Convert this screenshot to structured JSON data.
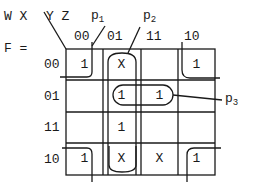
{
  "function_label": "F =",
  "row_vars": "W X",
  "col_vars": "Y Z",
  "col_headers": [
    "00",
    "01",
    "11",
    "10"
  ],
  "row_headers": [
    "00",
    "01",
    "11",
    "10"
  ],
  "cells": [
    [
      "1",
      "X",
      "",
      "1"
    ],
    [
      "",
      "1",
      "1",
      ""
    ],
    [
      "",
      "1",
      "",
      ""
    ],
    [
      "1",
      "X",
      "X",
      "1"
    ]
  ],
  "groups": [
    {
      "name": "p",
      "sub": "1",
      "desc": "four corners (WX=00/10, YZ=00/10)"
    },
    {
      "name": "p",
      "sub": "2",
      "desc": "column YZ=01, all rows"
    },
    {
      "name": "p",
      "sub": "3",
      "desc": "row WX=01, YZ=01 and 11"
    }
  ]
}
